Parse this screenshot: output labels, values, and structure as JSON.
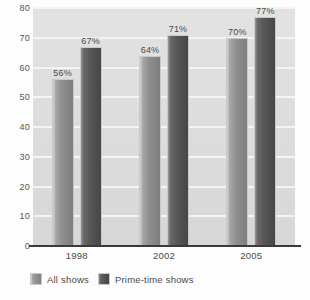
{
  "chart_data": {
    "type": "bar",
    "title": "",
    "subtitle": "",
    "xlabel": "",
    "ylabel": "",
    "categories": [
      "1998",
      "2002",
      "2005"
    ],
    "series": [
      {
        "name": "All shows",
        "color": "#8a8a8a",
        "values": [
          56,
          64,
          70
        ],
        "data_labels": [
          "56%",
          "64%",
          "70%"
        ]
      },
      {
        "name": "Prime-time shows",
        "color": "#4e4e4e",
        "values": [
          67,
          71,
          77
        ],
        "data_labels": [
          "67%",
          "71%",
          "77%"
        ]
      }
    ],
    "ylim": [
      0,
      80
    ],
    "ytick_values": [
      0,
      10,
      20,
      30,
      40,
      50,
      60,
      70,
      80
    ],
    "ytick_labels": [
      "0",
      "10",
      "20",
      "30",
      "40",
      "50",
      "60",
      "70",
      "80"
    ],
    "grid": true,
    "grid_axis": "y",
    "legend_position": "bottom-left",
    "value_unit": "%"
  },
  "colors": {
    "plot_background": "#dcdcdc",
    "page_background": "#fdfdfd",
    "gridline": "#f4f4f4",
    "axis_line": "#3a3a3a",
    "text": "#4a4a4a"
  }
}
